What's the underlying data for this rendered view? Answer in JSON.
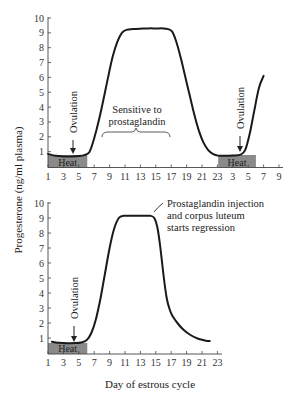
{
  "chart_data": [
    {
      "type": "line",
      "panel": "top",
      "title": "",
      "ylabel": "Progesterone (ng/ml plasma)",
      "xlabel": "Day of estrous cycle",
      "ylim": [
        0,
        10
      ],
      "yticks": [
        "1",
        "2",
        "3",
        "4",
        "5",
        "6",
        "7",
        "8",
        "9",
        "10"
      ],
      "xticks": [
        "1",
        "3",
        "5",
        "7",
        "9",
        "11",
        "13",
        "15",
        "17",
        "19",
        "21",
        "23",
        "3",
        "5",
        "7",
        "9"
      ],
      "series": [
        {
          "name": "Progesterone",
          "x": [
            1.0,
            2.0,
            3.0,
            4.0,
            5.0,
            5.8,
            6.4,
            7.0,
            7.6,
            8.2,
            8.8,
            9.4,
            10.0,
            10.6,
            11.2,
            12.0,
            13.0,
            14.0,
            15.0,
            16.0,
            16.6,
            17.1,
            17.6,
            18.2,
            18.8,
            19.4,
            20.0,
            20.6,
            21.2,
            21.8,
            22.4,
            23.0,
            24.0,
            25.0,
            26.0,
            26.6,
            27.2,
            27.8,
            28.4,
            29.0
          ],
          "y": [
            0.85,
            0.72,
            0.68,
            0.68,
            0.7,
            0.78,
            1.0,
            1.9,
            3.1,
            4.5,
            6.0,
            7.4,
            8.4,
            9.0,
            9.2,
            9.25,
            9.28,
            9.3,
            9.3,
            9.3,
            9.25,
            9.1,
            8.5,
            7.4,
            6.1,
            4.8,
            3.5,
            2.4,
            1.6,
            1.1,
            0.85,
            0.75,
            0.72,
            0.74,
            0.8,
            1.1,
            2.2,
            3.8,
            5.3,
            6.1
          ]
        }
      ],
      "shaded_regions": [
        {
          "label": "Heat",
          "x_start": 1,
          "x_end": 6.1
        },
        {
          "label": "Heat",
          "x_start": 23.1,
          "x_end": 28
        }
      ],
      "annotations": [
        {
          "text": "Ovulation",
          "x": 4.3,
          "kind": "arrow-down"
        },
        {
          "text": "Ovulation",
          "x": 25.6,
          "kind": "arrow-down"
        },
        {
          "text_lines": [
            "Sensitive to",
            "prostaglandin"
          ],
          "brace_x_start": 8,
          "brace_x_end": 17
        }
      ]
    },
    {
      "type": "line",
      "panel": "bottom",
      "title": "",
      "ylabel": "Progesterone (ng/ml plasma)",
      "xlabel": "Day of estrous cycle",
      "ylim": [
        0,
        10
      ],
      "yticks": [
        "1",
        "2",
        "3",
        "4",
        "5",
        "6",
        "7",
        "8",
        "9",
        "10"
      ],
      "xticks": [
        "1",
        "3",
        "5",
        "7",
        "9",
        "11",
        "13",
        "15",
        "17",
        "19",
        "21",
        "23"
      ],
      "series": [
        {
          "name": "Progesterone (prostaglandin injected)",
          "x": [
            1.5,
            2.5,
            3.5,
            4.5,
            5.3,
            6.0,
            6.6,
            7.2,
            7.8,
            8.4,
            9.0,
            9.6,
            10.2,
            10.8,
            11.5,
            12.5,
            13.5,
            14.3,
            14.8,
            15.2,
            15.6,
            16.0,
            16.4,
            16.8,
            17.2,
            17.8,
            18.6,
            19.5,
            20.5,
            21.5,
            22.0
          ],
          "y": [
            0.75,
            0.68,
            0.65,
            0.66,
            0.7,
            0.85,
            1.3,
            2.2,
            3.6,
            5.3,
            7.0,
            8.3,
            9.0,
            9.15,
            9.15,
            9.15,
            9.15,
            9.15,
            9.0,
            8.4,
            7.0,
            5.2,
            3.7,
            2.9,
            2.45,
            2.0,
            1.55,
            1.2,
            0.95,
            0.82,
            0.8
          ]
        }
      ],
      "shaded_regions": [
        {
          "label": "Heat",
          "x_start": 1,
          "x_end": 6.1
        }
      ],
      "annotations": [
        {
          "text": "Ovulation",
          "x": 4.5,
          "kind": "arrow-down"
        },
        {
          "text_lines": [
            "Prostaglandin injection",
            "and corpus luteum",
            "starts regression"
          ],
          "x": 14.3
        }
      ]
    }
  ],
  "labels": {
    "ylabel": "Progesterone (ng/ml plasma)",
    "xlabel": "Day of estrous cycle",
    "heat": "Heat",
    "ovulation": "Ovulation",
    "sensitive_line1": "Sensitive to",
    "sensitive_line2": "prostaglandin",
    "injection_line1": "Prostaglandin injection",
    "injection_line2": "and corpus luteum",
    "injection_line3": "starts regression"
  },
  "colors": {
    "curve": "#1a1a1a",
    "axis": "#444444",
    "heat_fill": "#8a8a8a",
    "text": "#222222"
  }
}
